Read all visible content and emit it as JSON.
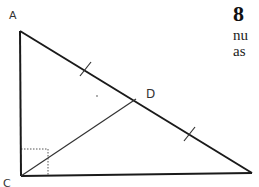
{
  "diagram": {
    "type": "right-triangle-geometry",
    "vertices": {
      "A": {
        "label": "A",
        "x": 20,
        "y": 31
      },
      "C": {
        "label": "C",
        "x": 21,
        "y": 176
      },
      "B": {
        "label": "",
        "x": 252,
        "y": 173
      },
      "D": {
        "label": "D",
        "x": 136,
        "y": 99
      }
    },
    "labels": {
      "A": "A",
      "C": "C",
      "D": "D"
    },
    "segments": [
      {
        "from": "A",
        "to": "C",
        "name": "side-AC"
      },
      {
        "from": "C",
        "to": "B",
        "name": "side-CB"
      },
      {
        "from": "A",
        "to": "B",
        "name": "hypotenuse-AB"
      },
      {
        "from": "C",
        "to": "D",
        "name": "median-CD"
      }
    ],
    "equal_marks": [
      {
        "segment": "AD",
        "x": 86,
        "y": 70
      },
      {
        "segment": "DB",
        "x": 190,
        "y": 134
      }
    ],
    "right_angle_at": "C",
    "stroke_color": "#1a1a1a",
    "dotted_color": "#555555"
  },
  "text": {
    "problem_number": "8",
    "line1": "nu",
    "line2": "as"
  }
}
